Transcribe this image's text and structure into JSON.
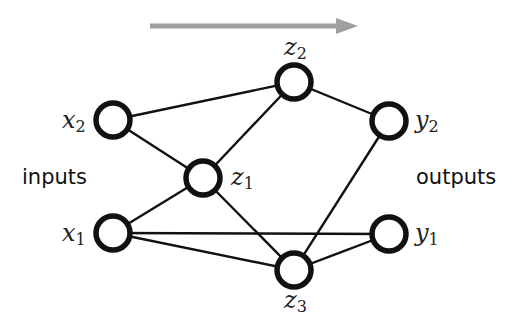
{
  "diagram": {
    "arrow": {
      "color": "#a0a0a0",
      "direction": "left-to-right"
    },
    "labels": {
      "inputs": "inputs",
      "outputs": "outputs"
    },
    "nodes": [
      {
        "id": "x2",
        "var": "x",
        "sub": "2",
        "cx": 113,
        "cy": 120,
        "label_side": "left"
      },
      {
        "id": "x1",
        "var": "x",
        "sub": "1",
        "cx": 113,
        "cy": 233,
        "label_side": "left"
      },
      {
        "id": "z1",
        "var": "z",
        "sub": "1",
        "cx": 203,
        "cy": 178,
        "label_side": "right"
      },
      {
        "id": "z2",
        "var": "z",
        "sub": "2",
        "cx": 294,
        "cy": 82,
        "label_side": "top"
      },
      {
        "id": "z3",
        "var": "z",
        "sub": "3",
        "cx": 294,
        "cy": 270,
        "label_side": "bottom"
      },
      {
        "id": "y2",
        "var": "y",
        "sub": "2",
        "cx": 389,
        "cy": 121,
        "label_side": "right"
      },
      {
        "id": "y1",
        "var": "y",
        "sub": "1",
        "cx": 389,
        "cy": 234,
        "label_side": "right"
      }
    ],
    "edges": [
      [
        "x2",
        "z2"
      ],
      [
        "x2",
        "z1"
      ],
      [
        "z1",
        "z2"
      ],
      [
        "x1",
        "z1"
      ],
      [
        "x1",
        "y1"
      ],
      [
        "x1",
        "z3"
      ],
      [
        "z1",
        "z3"
      ],
      [
        "z2",
        "y2"
      ],
      [
        "y2",
        "z3"
      ],
      [
        "z3",
        "y1"
      ]
    ]
  }
}
